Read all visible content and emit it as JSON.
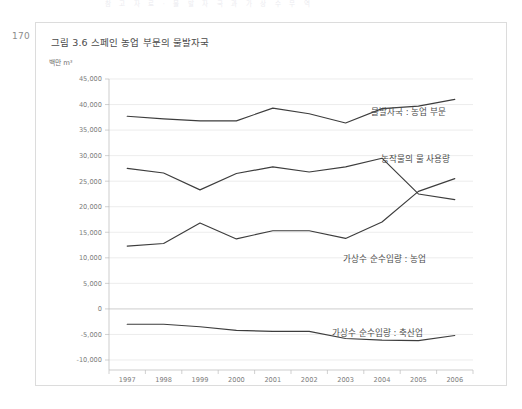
{
  "page": {
    "number": "170",
    "running_head": "참 고 자 료   ·   물 발 자 국 과   가 상 수   무 역"
  },
  "figure": {
    "title": "그림 3.6 스페인 농업 부문의 물발자국",
    "unit": "백만 m³"
  },
  "chart_data": {
    "type": "line",
    "title": "그림 3.6 스페인 농업 부문의 물발자국",
    "xlabel": "",
    "ylabel": "백만 m³",
    "ylim": [
      -10000,
      45000
    ],
    "ytick_step": 5000,
    "grid": true,
    "legend": "inline-labels",
    "categories": [
      "1997",
      "1998",
      "1999",
      "2000",
      "2001",
      "2002",
      "2003",
      "2004",
      "2005",
      "2006"
    ],
    "ytick_labels": [
      "45,000",
      "40,000",
      "35,000",
      "30,000",
      "25,000",
      "20,000",
      "15,000",
      "10,000",
      "5,000",
      "0",
      "-5,000",
      "-10,000"
    ],
    "series": [
      {
        "name": "물발자국 : 농업 부문",
        "values": [
          37700,
          37200,
          36800,
          36800,
          39300,
          38200,
          36400,
          39200,
          39700,
          41000
        ]
      },
      {
        "name": "농작물의 물 사용량",
        "values": [
          27500,
          26600,
          23300,
          26500,
          27800,
          26800,
          27800,
          29500,
          22500,
          21400
        ]
      },
      {
        "name": "가상수 순수입량 : 농업",
        "values": [
          12300,
          12800,
          16800,
          13700,
          15300,
          15300,
          13800,
          17000,
          23000,
          25500
        ]
      },
      {
        "name": "가상수 순수입량 : 축산업",
        "values": [
          -3000,
          -3000,
          -3500,
          -4200,
          -4400,
          -4400,
          -5800,
          -6100,
          -6200,
          -5200
        ]
      }
    ]
  }
}
